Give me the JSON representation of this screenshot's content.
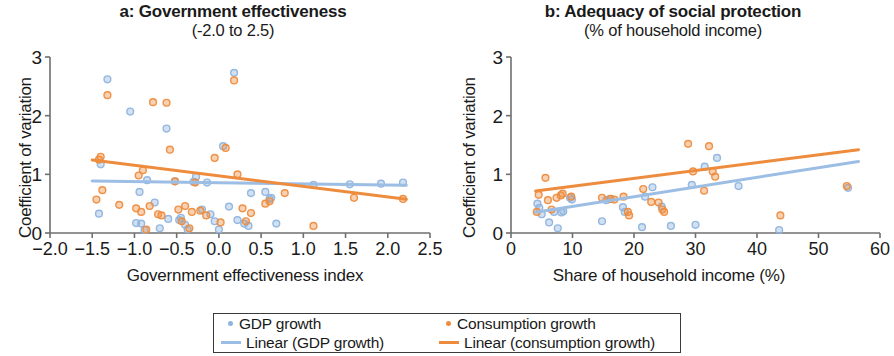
{
  "figure": {
    "legend": {
      "items": [
        {
          "label": "GDP growth",
          "marker": "dot",
          "color": "#8FB4DE"
        },
        {
          "label": "Consumption growth",
          "marker": "dot",
          "color": "#EE8C3E"
        },
        {
          "label": "Linear (GDP growth)",
          "marker": "line",
          "color": "#9CBEE4"
        },
        {
          "label": "Linear (consumption growth)",
          "marker": "line",
          "color": "#EE8C3E"
        }
      ]
    }
  },
  "chart_data": [
    {
      "type": "scatter",
      "panel": "a",
      "title": "a: Government effectiveness",
      "subtitle": "(-2.0 to 2.5)",
      "xlabel": "Government effectiveness index",
      "ylabel": "Coefficient of variation",
      "xlim": [
        -2.0,
        2.5
      ],
      "ylim": [
        0,
        3
      ],
      "xticks": [
        -2.0,
        -1.5,
        -1.0,
        -0.5,
        0.0,
        0.5,
        1.0,
        1.5,
        2.0,
        2.5
      ],
      "xticklabels": [
        "−2.0",
        "−1.5",
        "−1.0",
        "−0.5",
        "0.0",
        "0.5",
        "1.0",
        "1.5",
        "2.0",
        "2.5"
      ],
      "yticks": [
        0,
        1,
        2,
        3
      ],
      "yticklabels": [
        "0",
        "1",
        "2",
        "3"
      ],
      "grid": false,
      "legend_position": "below-figure",
      "series": [
        {
          "name": "GDP growth",
          "color": "#8FB4DE",
          "points": [
            [
              -1.42,
              0.33
            ],
            [
              -1.4,
              1.17
            ],
            [
              -1.32,
              2.62
            ],
            [
              -1.05,
              2.07
            ],
            [
              -0.98,
              0.17
            ],
            [
              -0.94,
              0.7
            ],
            [
              -0.92,
              0.16
            ],
            [
              -0.88,
              0.05
            ],
            [
              -0.85,
              0.9
            ],
            [
              -0.76,
              0.52
            ],
            [
              -0.7,
              0.08
            ],
            [
              -0.62,
              1.78
            ],
            [
              -0.6,
              0.24
            ],
            [
              -0.52,
              0.88
            ],
            [
              -0.47,
              0.22
            ],
            [
              -0.45,
              0.26
            ],
            [
              -0.4,
              0.14
            ],
            [
              -0.37,
              0.06
            ],
            [
              -0.3,
              0.87
            ],
            [
              -0.27,
              0.96
            ],
            [
              -0.2,
              0.4
            ],
            [
              -0.14,
              0.86
            ],
            [
              -0.1,
              0.32
            ],
            [
              -0.05,
              0.2
            ],
            [
              0.0,
              0.06
            ],
            [
              0.05,
              1.48
            ],
            [
              0.12,
              0.45
            ],
            [
              0.18,
              2.73
            ],
            [
              0.22,
              0.22
            ],
            [
              0.3,
              0.16
            ],
            [
              0.35,
              0.12
            ],
            [
              0.38,
              0.68
            ],
            [
              0.55,
              0.7
            ],
            [
              0.6,
              0.58
            ],
            [
              0.62,
              0.6
            ],
            [
              0.68,
              0.16
            ],
            [
              1.12,
              0.82
            ],
            [
              1.55,
              0.83
            ],
            [
              1.92,
              0.84
            ],
            [
              2.18,
              0.86
            ]
          ]
        },
        {
          "name": "Consumption growth",
          "color": "#EE8C3E",
          "points": [
            [
              -1.45,
              0.57
            ],
            [
              -1.42,
              1.25
            ],
            [
              -1.4,
              1.3
            ],
            [
              -1.38,
              0.73
            ],
            [
              -1.32,
              2.35
            ],
            [
              -1.18,
              0.48
            ],
            [
              -0.98,
              0.42
            ],
            [
              -0.95,
              0.98
            ],
            [
              -0.92,
              0.36
            ],
            [
              -0.9,
              1.07
            ],
            [
              -0.86,
              0.06
            ],
            [
              -0.82,
              0.46
            ],
            [
              -0.78,
              2.23
            ],
            [
              -0.72,
              0.32
            ],
            [
              -0.68,
              0.3
            ],
            [
              -0.62,
              2.22
            ],
            [
              -0.58,
              1.42
            ],
            [
              -0.52,
              0.88
            ],
            [
              -0.48,
              0.4
            ],
            [
              -0.44,
              0.2
            ],
            [
              -0.4,
              0.46
            ],
            [
              -0.35,
              0.08
            ],
            [
              -0.32,
              0.36
            ],
            [
              -0.28,
              0.86
            ],
            [
              -0.22,
              0.38
            ],
            [
              -0.15,
              0.3
            ],
            [
              -0.05,
              1.28
            ],
            [
              0.02,
              0.18
            ],
            [
              0.08,
              1.45
            ],
            [
              0.18,
              2.6
            ],
            [
              0.22,
              1.0
            ],
            [
              0.28,
              0.42
            ],
            [
              0.32,
              0.2
            ],
            [
              0.38,
              0.34
            ],
            [
              0.55,
              0.5
            ],
            [
              0.6,
              0.54
            ],
            [
              0.78,
              0.68
            ],
            [
              1.12,
              0.12
            ],
            [
              1.6,
              0.6
            ],
            [
              2.18,
              0.58
            ]
          ]
        }
      ],
      "trend_lines": [
        {
          "name": "Linear (GDP growth)",
          "color": "#9CBEE4",
          "x0": -1.5,
          "y0": 0.885,
          "x1": 2.22,
          "y1": 0.815
        },
        {
          "name": "Linear (consumption growth)",
          "color": "#EE8C3E",
          "x0": -1.5,
          "y0": 1.245,
          "x1": 2.22,
          "y1": 0.575
        }
      ]
    },
    {
      "type": "scatter",
      "panel": "b",
      "title": "b: Adequacy of social protection",
      "subtitle": "(% of household income)",
      "xlabel": "Share of household income (%)",
      "ylabel": "Coefficient of variation",
      "xlim": [
        0,
        60
      ],
      "ylim": [
        0,
        3
      ],
      "xticks": [
        0,
        10,
        20,
        30,
        40,
        50,
        60
      ],
      "xticklabels": [
        "0",
        "10",
        "20",
        "30",
        "40",
        "50",
        "60"
      ],
      "yticks": [
        0,
        1,
        2,
        3
      ],
      "yticklabels": [
        "0",
        "1",
        "2",
        "3"
      ],
      "grid": false,
      "legend_position": "below-figure",
      "series": [
        {
          "name": "GDP growth",
          "color": "#8FB4DE",
          "points": [
            [
              4.3,
              0.5
            ],
            [
              4.6,
              0.43
            ],
            [
              5.0,
              0.32
            ],
            [
              6.2,
              0.18
            ],
            [
              7.0,
              0.36
            ],
            [
              7.6,
              0.08
            ],
            [
              8.2,
              0.35
            ],
            [
              8.5,
              0.37
            ],
            [
              9.6,
              0.6
            ],
            [
              9.9,
              0.57
            ],
            [
              14.8,
              0.2
            ],
            [
              15.5,
              0.56
            ],
            [
              16.1,
              0.58
            ],
            [
              18.2,
              0.44
            ],
            [
              18.5,
              0.36
            ],
            [
              21.3,
              0.1
            ],
            [
              21.8,
              0.62
            ],
            [
              23.0,
              0.78
            ],
            [
              24.5,
              0.45
            ],
            [
              26.0,
              0.12
            ],
            [
              29.4,
              0.82
            ],
            [
              30.0,
              0.14
            ],
            [
              31.5,
              1.13
            ],
            [
              33.5,
              1.28
            ],
            [
              37.0,
              0.8
            ],
            [
              43.6,
              0.05
            ],
            [
              54.8,
              0.77
            ]
          ]
        },
        {
          "name": "Consumption growth",
          "color": "#EE8C3E",
          "points": [
            [
              4.2,
              0.36
            ],
            [
              4.5,
              0.65
            ],
            [
              5.6,
              0.94
            ],
            [
              6.0,
              0.56
            ],
            [
              6.6,
              0.4
            ],
            [
              7.4,
              0.6
            ],
            [
              8.1,
              0.64
            ],
            [
              8.4,
              0.67
            ],
            [
              9.8,
              0.62
            ],
            [
              14.8,
              0.6
            ],
            [
              16.2,
              0.58
            ],
            [
              16.8,
              0.57
            ],
            [
              18.3,
              0.62
            ],
            [
              19.0,
              0.36
            ],
            [
              19.2,
              0.3
            ],
            [
              21.5,
              0.75
            ],
            [
              22.8,
              0.53
            ],
            [
              24.0,
              0.52
            ],
            [
              24.6,
              0.4
            ],
            [
              24.9,
              0.36
            ],
            [
              28.8,
              1.52
            ],
            [
              29.6,
              1.05
            ],
            [
              31.4,
              0.72
            ],
            [
              32.2,
              1.48
            ],
            [
              32.8,
              1.05
            ],
            [
              33.2,
              0.96
            ],
            [
              43.8,
              0.3
            ],
            [
              54.6,
              0.8
            ]
          ]
        }
      ],
      "trend_lines": [
        {
          "name": "Linear (GDP growth)",
          "color": "#9CBEE4",
          "x0": 4.0,
          "y0": 0.355,
          "x1": 56.5,
          "y1": 1.22
        },
        {
          "name": "Linear (consumption growth)",
          "color": "#EE8C3E",
          "x0": 4.0,
          "y0": 0.715,
          "x1": 56.5,
          "y1": 1.42
        }
      ]
    }
  ]
}
